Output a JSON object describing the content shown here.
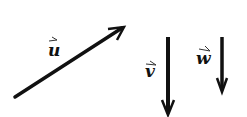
{
  "diagram": {
    "title": "",
    "stroke_color": "#111111",
    "background": "#ffffff",
    "vectors": [
      {
        "name": "u",
        "label": "u",
        "from": [
          15,
          97
        ],
        "to": [
          124,
          27
        ],
        "label_pos": [
          48,
          56
        ],
        "accent_pos": [
          49,
          41
        ]
      },
      {
        "name": "v",
        "label": "v",
        "from": [
          168,
          37
        ],
        "to": [
          168,
          115
        ],
        "label_pos": [
          145,
          77
        ],
        "accent_pos": [
          146,
          63
        ]
      },
      {
        "name": "w",
        "label": "w",
        "from": [
          222,
          37
        ],
        "to": [
          222,
          92
        ],
        "label_pos": [
          196,
          64
        ],
        "accent_pos": [
          199,
          50
        ]
      }
    ]
  }
}
